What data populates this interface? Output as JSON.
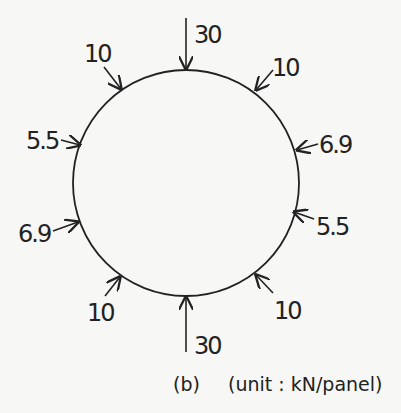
{
  "diagram": {
    "unit_note": "(unit : kN/panel)",
    "panel_label": "(b)",
    "ring": {
      "cx": 186,
      "cy": 183,
      "r": 113
    },
    "loads": [
      {
        "id": "top",
        "value": "30",
        "position": "top",
        "direction": "inward"
      },
      {
        "id": "top-left",
        "value": "10",
        "position": "upper-left",
        "direction": "inward"
      },
      {
        "id": "top-right",
        "value": "10",
        "position": "upper-right",
        "direction": "inward"
      },
      {
        "id": "left-upper",
        "value": "5.5",
        "position": "left-upper",
        "direction": "inward"
      },
      {
        "id": "right-upper",
        "value": "6.9",
        "position": "right-upper",
        "direction": "inward"
      },
      {
        "id": "left-lower",
        "value": "6.9",
        "position": "left-lower",
        "direction": "inward"
      },
      {
        "id": "right-lower",
        "value": "5.5",
        "position": "right-lower",
        "direction": "inward"
      },
      {
        "id": "bottom-left",
        "value": "10",
        "position": "lower-left",
        "direction": "inward"
      },
      {
        "id": "bottom-right",
        "value": "10",
        "position": "lower-right",
        "direction": "inward"
      },
      {
        "id": "bottom",
        "value": "30",
        "position": "bottom",
        "direction": "inward"
      }
    ]
  }
}
